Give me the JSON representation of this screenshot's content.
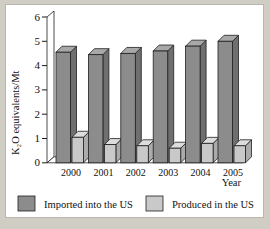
{
  "chart_data": {
    "type": "bar",
    "title": "",
    "subtitle": "",
    "xlabel": "Year",
    "ylabel": "K2O equivalents/Mt",
    "ylabel_display": "K₂O equivalents/Mt",
    "categories": [
      "2000",
      "2001",
      "2002",
      "2003",
      "2004",
      "2005"
    ],
    "series": [
      {
        "name": "Imported into the US",
        "values": [
          4.55,
          4.45,
          4.5,
          4.6,
          4.8,
          5.0
        ],
        "color": "#8c8c8c"
      },
      {
        "name": "Produced in the US",
        "values": [
          1.05,
          0.75,
          0.7,
          0.6,
          0.8,
          0.7
        ],
        "color": "#c9c9c9"
      }
    ],
    "ylim": [
      0,
      6
    ],
    "yticks": [
      "0",
      "1",
      "2",
      "3",
      "4",
      "5",
      "6"
    ],
    "ytick_values": [
      0,
      1,
      2,
      3,
      4,
      5,
      6
    ],
    "grid": false,
    "legend_position": "bottom",
    "style": "3d-column"
  },
  "legend": {
    "items": [
      {
        "label": "Imported into the US",
        "color": "#8c8c8c"
      },
      {
        "label": "Produced in the US",
        "color": "#c9c9c9"
      }
    ]
  },
  "axis": {
    "y_title": "K₂O equivalents/Mt",
    "x_title": "Year",
    "y_ticks": [
      "6",
      "5",
      "4",
      "3",
      "2",
      "1",
      "0"
    ],
    "x_ticks": [
      "2000",
      "2001",
      "2002",
      "2003",
      "2004",
      "2005"
    ]
  },
  "colors": {
    "bar_imported": "#8c8c8c",
    "bar_imported_top": "#a8a8a8",
    "bar_imported_side": "#6f6f6f",
    "bar_produced": "#c9c9c9",
    "bar_produced_top": "#dcdcdc",
    "bar_produced_side": "#ababab",
    "outline": "#1f1f1f",
    "page_background": "#cfcdc4",
    "plot_background": "#ffffff"
  }
}
